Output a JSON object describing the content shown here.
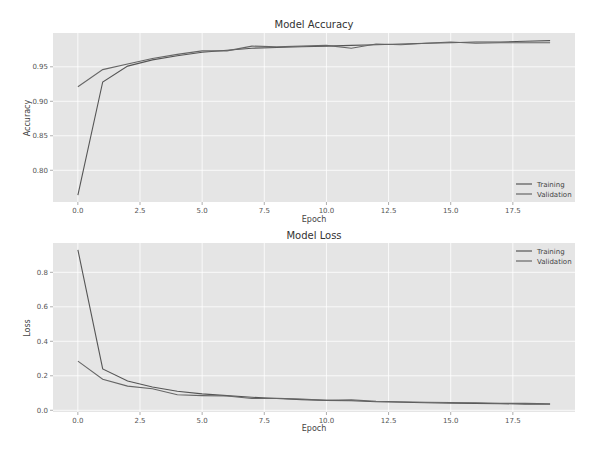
{
  "chart_data": [
    {
      "type": "line",
      "title": "Model Accuracy",
      "xlabel": "Epoch",
      "ylabel": "Accuracy",
      "xlim": [
        -1,
        20
      ],
      "ylim": [
        0.754,
        0.999
      ],
      "xticks": [
        "0.0",
        "2.5",
        "5.0",
        "7.5",
        "10.0",
        "12.5",
        "15.0",
        "17.5"
      ],
      "xtick_values": [
        0,
        2.5,
        5,
        7.5,
        10,
        12.5,
        15,
        17.5
      ],
      "yticks": [
        "0.80",
        "0.85",
        "0.90",
        "0.95"
      ],
      "ytick_values": [
        0.8,
        0.85,
        0.9,
        0.95
      ],
      "grid": true,
      "legend_position": "lower right",
      "x": [
        0,
        1,
        2,
        3,
        4,
        5,
        6,
        7,
        8,
        9,
        10,
        11,
        12,
        13,
        14,
        15,
        16,
        17,
        18,
        19
      ],
      "series": [
        {
          "name": "Training",
          "color": "#555555",
          "values": [
            0.764,
            0.928,
            0.951,
            0.96,
            0.966,
            0.971,
            0.974,
            0.977,
            0.978,
            0.979,
            0.98,
            0.981,
            0.982,
            0.983,
            0.984,
            0.985,
            0.986,
            0.986,
            0.987,
            0.988
          ]
        },
        {
          "name": "Validation",
          "color": "#666666",
          "values": [
            0.921,
            0.946,
            0.954,
            0.962,
            0.968,
            0.973,
            0.973,
            0.98,
            0.979,
            0.98,
            0.981,
            0.977,
            0.983,
            0.982,
            0.984,
            0.986,
            0.984,
            0.985,
            0.985,
            0.985
          ]
        }
      ]
    },
    {
      "type": "line",
      "title": "Model Loss",
      "xlabel": "Epoch",
      "ylabel": "Loss",
      "xlim": [
        -1,
        20
      ],
      "ylim": [
        -0.01,
        0.97
      ],
      "xticks": [
        "0.0",
        "2.5",
        "5.0",
        "7.5",
        "10.0",
        "12.5",
        "15.0",
        "17.5"
      ],
      "xtick_values": [
        0,
        2.5,
        5,
        7.5,
        10,
        12.5,
        15,
        17.5
      ],
      "yticks": [
        "0.0",
        "0.2",
        "0.4",
        "0.6",
        "0.8"
      ],
      "ytick_values": [
        0.0,
        0.2,
        0.4,
        0.6,
        0.8
      ],
      "grid": true,
      "legend_position": "upper right",
      "x": [
        0,
        1,
        2,
        3,
        4,
        5,
        6,
        7,
        8,
        9,
        10,
        11,
        12,
        13,
        14,
        15,
        16,
        17,
        18,
        19
      ],
      "series": [
        {
          "name": "Training",
          "color": "#555555",
          "values": [
            0.93,
            0.24,
            0.17,
            0.135,
            0.11,
            0.095,
            0.085,
            0.075,
            0.068,
            0.062,
            0.057,
            0.055,
            0.05,
            0.047,
            0.044,
            0.041,
            0.04,
            0.038,
            0.036,
            0.035
          ]
        },
        {
          "name": "Validation",
          "color": "#666666",
          "values": [
            0.285,
            0.18,
            0.14,
            0.125,
            0.09,
            0.085,
            0.083,
            0.068,
            0.07,
            0.065,
            0.058,
            0.06,
            0.052,
            0.05,
            0.047,
            0.045,
            0.044,
            0.04,
            0.04,
            0.038
          ]
        }
      ]
    }
  ]
}
